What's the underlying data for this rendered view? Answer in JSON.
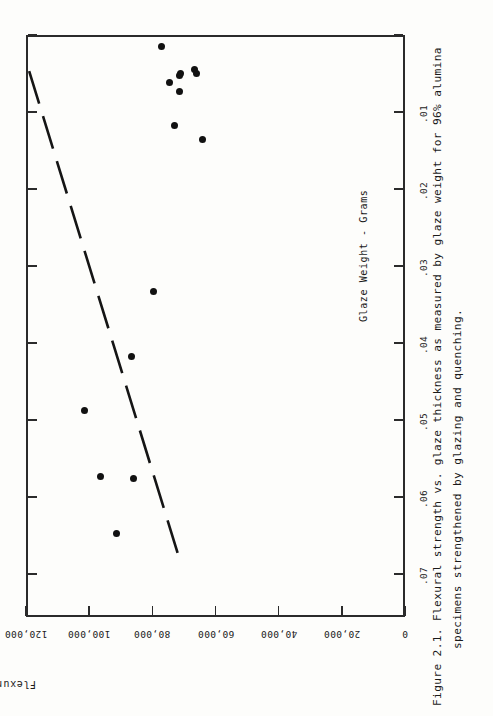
{
  "page": {
    "bleed_text": "",
    "caption_label": "Figure 2.1.",
    "caption_line1": "Flexural strength vs. glaze thickness as measured by glaze weight for 96% alumina",
    "caption_line2": "specimens strengthened by glazing and quenching.",
    "ink_color": "#1a1a1a",
    "paper_color": "#fdfdfb"
  },
  "chart_data": {
    "type": "scatter",
    "title": "Flexural strength vs. glaze thickness as measured by glaze weight for 96% alumina specimens strengthened by glazing and quenching.",
    "figure_number": "Figure 2.1.",
    "orientation": "rotated-90-clockwise",
    "xlabel": "Glaze Weight - Grams",
    "ylabel": "Flexural Strength - psi",
    "xticks": [
      0,
      0.01,
      0.02,
      0.03,
      0.04,
      0.05,
      0.06,
      0.07
    ],
    "xticklabels": [
      "",
      ".01",
      ".02",
      ".03",
      ".04",
      ".05",
      ".06",
      ".07"
    ],
    "yticks": [
      0,
      20000,
      40000,
      60000,
      80000,
      100000,
      120000
    ],
    "yticklabels": [
      "0",
      "20,000",
      "40,000",
      "60,000",
      "80,000",
      "100,000",
      "120,000"
    ],
    "xlim": [
      0,
      0.0756
    ],
    "ylim": [
      0,
      120000
    ],
    "grid": false,
    "legend": null,
    "x": [
      0.0015,
      0.0045,
      0.005,
      0.0053,
      0.005,
      0.0062,
      0.0073,
      0.0117,
      0.0136,
      0.0333,
      0.0418,
      0.0488,
      0.0573,
      0.0576,
      0.0648
    ],
    "y": [
      77000,
      66500,
      71000,
      71500,
      66000,
      74500,
      71500,
      73000,
      64000,
      79500,
      86500,
      101500,
      96500,
      86000,
      91500
    ],
    "trendline": {
      "style": "dashed",
      "x_start": 0.0047,
      "y_start": 119000,
      "x_end": 0.0686,
      "y_end": 71000
    }
  }
}
